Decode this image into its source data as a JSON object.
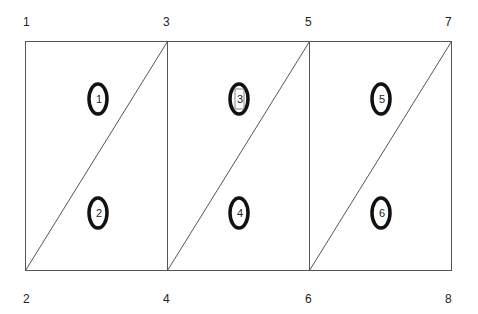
{
  "diagram": {
    "nodes": [
      {
        "id": "1",
        "x": 26,
        "y": 23
      },
      {
        "id": "2",
        "x": 26,
        "y": 300
      },
      {
        "id": "3",
        "x": 166,
        "y": 23
      },
      {
        "id": "4",
        "x": 166,
        "y": 300
      },
      {
        "id": "5",
        "x": 308,
        "y": 23
      },
      {
        "id": "6",
        "x": 308,
        "y": 300
      },
      {
        "id": "7",
        "x": 448,
        "y": 23
      },
      {
        "id": "8",
        "x": 448,
        "y": 300
      }
    ],
    "elements": [
      {
        "id": "1",
        "cx": 98,
        "cy": 99,
        "boxed": false
      },
      {
        "id": "2",
        "cx": 98,
        "cy": 213,
        "boxed": false
      },
      {
        "id": "3",
        "cx": 239,
        "cy": 99,
        "boxed": true
      },
      {
        "id": "4",
        "cx": 239,
        "cy": 213,
        "boxed": false
      },
      {
        "id": "5",
        "cx": 381,
        "cy": 99,
        "boxed": false
      },
      {
        "id": "6",
        "cx": 381,
        "cy": 213,
        "boxed": false
      }
    ],
    "colors": {
      "line": "#555555",
      "ellipse": "#111111",
      "text": "#222222"
    }
  }
}
